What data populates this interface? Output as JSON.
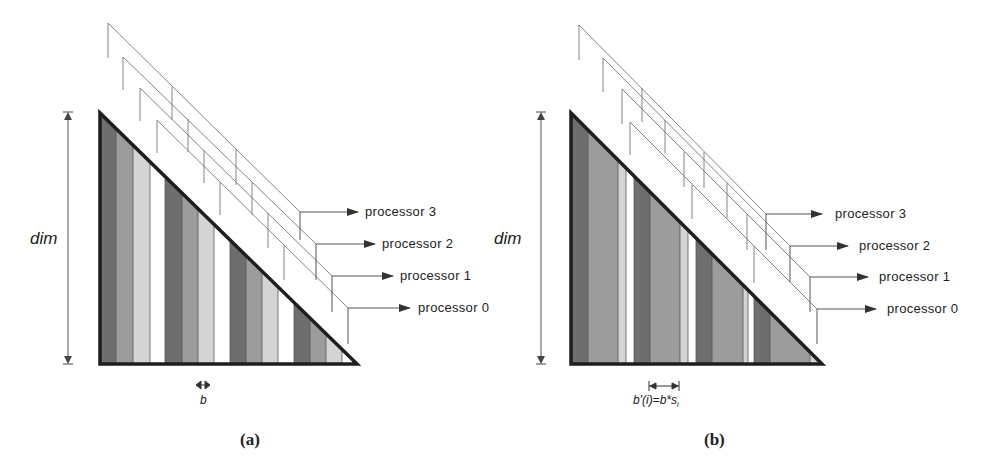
{
  "figure": {
    "panels": [
      {
        "id": "a",
        "caption": "(a)",
        "dim_label": "dim",
        "block_label": "b",
        "processor_labels": [
          "processor 3",
          "processor 2",
          "processor 1",
          "processor 0"
        ],
        "stripe_pattern": "cyclic blocks of equal width b assigned to processors 3,2,1,0 (dark to white)"
      },
      {
        "id": "b",
        "caption": "(b)",
        "dim_label": "dim",
        "block_label": "b'(i)=b*s",
        "block_label_subscript": "i",
        "processor_labels": [
          "processor 3",
          "processor 2",
          "processor 1",
          "processor 0"
        ],
        "stripe_pattern": "cyclic blocks of variable width b'(i) assigned to processors"
      }
    ],
    "colors": {
      "processor_3": "#6e6e6e",
      "processor_2": "#9c9c9c",
      "processor_1": "#d4d4d4",
      "processor_0": "#ffffff",
      "outline": "#1e1e1e",
      "leader": "#777777"
    }
  }
}
